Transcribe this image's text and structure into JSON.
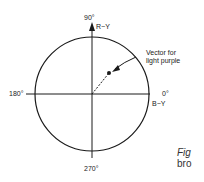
{
  "diagram": {
    "labels": {
      "top_angle": "90°",
      "top_axis": "R−Y",
      "left_angle": "180°",
      "right_angle": "0°",
      "right_axis": "B−Y",
      "bottom_angle": "270°",
      "vector_line1": "Vector for",
      "vector_line2": "light purple"
    },
    "caption": {
      "line1": "Fig",
      "line2": "bro"
    },
    "colors": {
      "stroke": "#1a1a1a",
      "background": "#ffffff"
    }
  }
}
